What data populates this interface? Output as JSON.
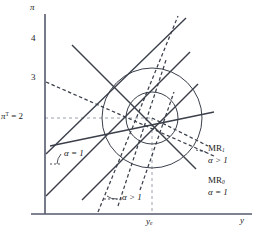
{
  "figure": {
    "type": "economics-diagram"
  },
  "axes": {
    "y_axis": {
      "name": "pi-axis",
      "label": "π",
      "ticks": [
        {
          "label": "4",
          "value": 4,
          "y_px": 40
        },
        {
          "label": "3",
          "value": 3,
          "y_px": 79
        },
        {
          "label": "2",
          "value": 2,
          "y_px": 118
        }
      ]
    },
    "x_axis": {
      "name": "y-axis",
      "label": "y",
      "ticks": [
        {
          "label": "y",
          "sub": "e",
          "x_px": 152
        }
      ]
    },
    "target_label": {
      "pre": "π",
      "sup": "T",
      "eq": " = 2"
    }
  },
  "annotations": {
    "alpha_eq_1_upper": "α = 1",
    "alpha_gt_1_lower": "α > 1",
    "mr1": {
      "name": "MR",
      "sub": "1",
      "cond": "α > 1"
    },
    "mr0": {
      "name": "MR",
      "sub": "0",
      "cond": "α = 1"
    }
  },
  "chart_data": {
    "type": "line",
    "title": "",
    "xlabel": "y",
    "ylabel": "π",
    "grid": false,
    "legend": "inline-right",
    "equilibrium": {
      "y_e": 152,
      "pi_T": 118
    },
    "circles": [
      {
        "name": "loss-circle-inner",
        "cx": 152,
        "cy": 118,
        "r": 26
      },
      {
        "name": "loss-circle-outer",
        "cx": 152,
        "cy": 118,
        "r": 50
      }
    ],
    "solid_lines": [
      {
        "name": "pc-low-1",
        "x1": 46,
        "y1": 196,
        "x2": 190,
        "y2": 52
      },
      {
        "name": "pc-low-2",
        "x1": 82,
        "y1": 200,
        "x2": 198,
        "y2": 84
      },
      {
        "name": "pc-mid",
        "x1": 46,
        "y1": 154,
        "x2": 186,
        "y2": 18
      },
      {
        "name": "mr0-line",
        "x1": 72,
        "y1": 45,
        "x2": 196,
        "y2": 169
      },
      {
        "name": "ad-line",
        "x1": 50,
        "y1": 146,
        "x2": 214,
        "y2": 112
      }
    ],
    "dashed_lines": [
      {
        "name": "pc-steep-1",
        "x1": 98,
        "y1": 212,
        "x2": 178,
        "y2": 16
      },
      {
        "name": "pc-steep-2",
        "x1": 118,
        "y1": 206,
        "x2": 166,
        "y2": 60
      },
      {
        "name": "pc-steep-3",
        "x1": 140,
        "y1": 190,
        "x2": 174,
        "y2": 92
      },
      {
        "name": "mr1-line",
        "x1": 46,
        "y1": 82,
        "x2": 214,
        "y2": 156
      },
      {
        "name": "mr1-tail",
        "x1": 152,
        "y1": 118,
        "x2": 208,
        "y2": 146
      }
    ],
    "guides": [
      {
        "name": "pi-target-guide",
        "x1": 45,
        "y1": 118,
        "x2": 152,
        "y2": 118
      },
      {
        "name": "y-e-guide",
        "x1": 152,
        "y1": 118,
        "x2": 152,
        "y2": 214
      }
    ]
  }
}
